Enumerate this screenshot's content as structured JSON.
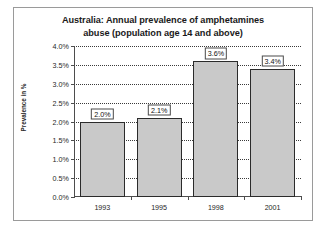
{
  "chart_data": {
    "type": "bar",
    "title": "Australia: Annual prevalence of amphetamines abuse (population age 14 and above)",
    "title_line1": "Australia: Annual prevalence of amphetamines",
    "title_line2": "abuse (population age 14 and above)",
    "xlabel": "",
    "ylabel": "Prevalence in %",
    "categories": [
      "1993",
      "1995",
      "1998",
      "2001"
    ],
    "values": [
      2.0,
      2.1,
      3.6,
      3.4
    ],
    "value_labels": [
      "2.0%",
      "2.1%",
      "3.6%",
      "3.4%"
    ],
    "ylim": [
      0.0,
      4.0
    ],
    "ytick_values": [
      0.0,
      0.5,
      1.0,
      1.5,
      2.0,
      2.5,
      3.0,
      3.5,
      4.0
    ],
    "ytick_labels": [
      "0.0%",
      "0.5%",
      "1.0%",
      "1.5%",
      "2.0%",
      "2.5%",
      "3.0%",
      "3.5%",
      "4.0%"
    ],
    "grid": true,
    "grid_style": "dotted-horizontal",
    "legend": false,
    "bar_color": "#c9c9c9",
    "bar_border_color": "#2b2b2b",
    "grid_color": "#3a3a3a",
    "axis_color": "#4d4d4d",
    "frame_color": "#9a9a9a",
    "background_color": "#ffffff"
  }
}
